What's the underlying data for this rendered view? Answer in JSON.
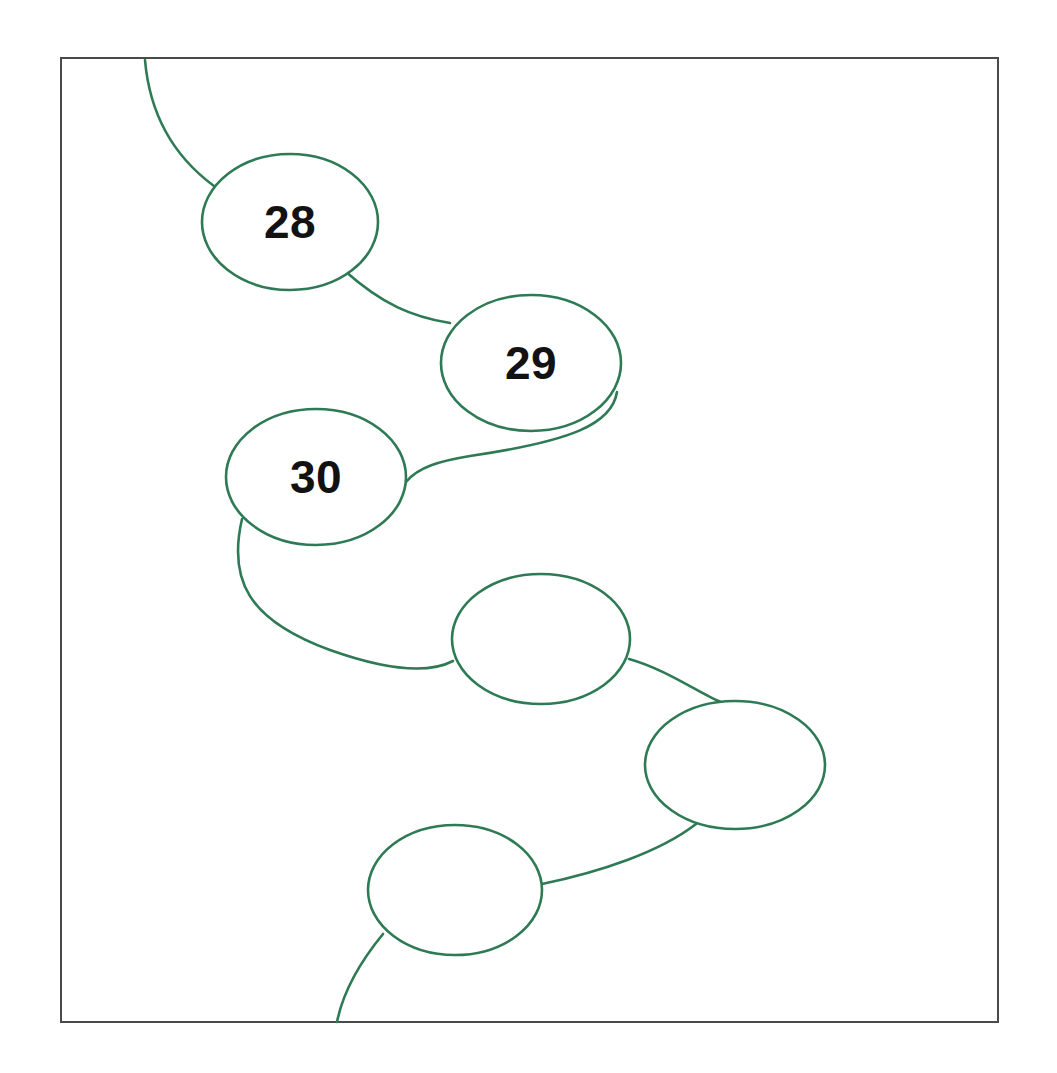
{
  "canvas": {
    "width": 1057,
    "height": 1073,
    "background": "#ffffff",
    "title": "Node Chain Diagram"
  },
  "frame": {
    "name": "diagram-border",
    "x": 61,
    "y": 58,
    "width": 937,
    "height": 964,
    "stroke": "#4a4a4a",
    "stroke_width": 2,
    "fill": "none"
  },
  "style": {
    "node_stroke": "#2d7a55",
    "node_fill": "#ffffff",
    "node_stroke_width": 2.6,
    "edge_stroke": "#2d7a55",
    "edge_stroke_width": 2.6,
    "label_color": "#121212",
    "label_font_size": 46
  },
  "chart_data": {
    "type": "diagram",
    "subtype": "node-link-chain",
    "title": "",
    "node_count": 6,
    "labels_shown": [
      "28",
      "29",
      "30"
    ],
    "nodes": [
      {
        "id": "n28",
        "label": "28",
        "cx": 290,
        "cy": 222,
        "rx": 88,
        "ry": 68,
        "has_label": true
      },
      {
        "id": "n29",
        "label": "29",
        "cx": 531,
        "cy": 363,
        "rx": 90,
        "ry": 68,
        "has_label": true
      },
      {
        "id": "n30",
        "label": "30",
        "cx": 316,
        "cy": 477,
        "rx": 90,
        "ry": 68,
        "has_label": true
      },
      {
        "id": "n4",
        "label": "",
        "cx": 541,
        "cy": 639,
        "rx": 89,
        "ry": 65,
        "has_label": false
      },
      {
        "id": "n5",
        "label": "",
        "cx": 735,
        "cy": 765,
        "rx": 90,
        "ry": 64,
        "has_label": false
      },
      {
        "id": "n6",
        "label": "",
        "cx": 455,
        "cy": 890,
        "rx": 87,
        "ry": 65,
        "has_label": false
      }
    ],
    "edges": [
      {
        "id": "e-in",
        "from": "canvas-top",
        "to": "n28",
        "path": "M 145 60 C 150 118 176 158 214 186"
      },
      {
        "id": "e-28-29",
        "from": "n28",
        "to": "n29",
        "path": "M 345 271 C 382 304 412 317 450 323"
      },
      {
        "id": "e-29-30",
        "from": "n29",
        "to": "n30",
        "path": "M 617 392 C 612 424 572 441 470 456 C 440 461 418 467 406 482"
      },
      {
        "id": "e-30-4",
        "from": "n30",
        "to": "n4",
        "path": "M 242 519 C 228 580 248 620 330 650 C 392 672 430 673 453 661"
      },
      {
        "id": "e-4-5",
        "from": "n4",
        "to": "n5",
        "path": "M 629 659 C 668 670 700 694 723 703"
      },
      {
        "id": "e-5-6",
        "from": "n5",
        "to": "n6",
        "path": "M 696 824 C 660 852 600 872 542 884"
      },
      {
        "id": "e-out",
        "from": "n6",
        "to": "canvas-bottom",
        "path": "M 383 934 C 360 962 343 992 337 1022"
      }
    ],
    "edge_entry_top": {
      "x": 145,
      "y": 60
    },
    "edge_exit_bottom": {
      "x": 337,
      "y": 1022
    }
  }
}
